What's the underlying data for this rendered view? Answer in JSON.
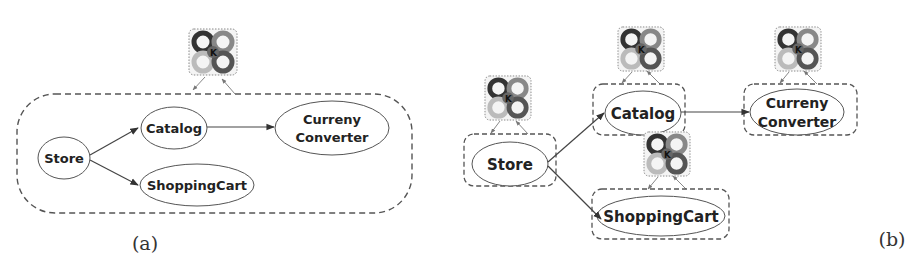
{
  "figure": {
    "panels": [
      {
        "id": "a",
        "caption": "(a)",
        "nodes": [
          {
            "id": "store",
            "label": [
              "Store"
            ]
          },
          {
            "id": "catalog",
            "label": [
              "Catalog"
            ]
          },
          {
            "id": "currency",
            "label": [
              "Curreny",
              "Converter"
            ]
          },
          {
            "id": "cart",
            "label": [
              "ShoppingCart"
            ]
          }
        ],
        "edges": [
          {
            "from": "store",
            "to": "catalog"
          },
          {
            "from": "store",
            "to": "cart"
          },
          {
            "from": "catalog",
            "to": "currency"
          }
        ],
        "controllers": 1,
        "controller_icon": "mape-k-loop-icon",
        "controller_letters": [
          "A",
          "P",
          "M",
          "E",
          "K"
        ]
      },
      {
        "id": "b",
        "caption": "(b)",
        "nodes": [
          {
            "id": "store",
            "label": [
              "Store"
            ]
          },
          {
            "id": "catalog",
            "label": [
              "Catalog"
            ]
          },
          {
            "id": "currency",
            "label": [
              "Curreny",
              "Converter"
            ]
          },
          {
            "id": "cart",
            "label": [
              "ShoppingCart"
            ]
          }
        ],
        "edges": [
          {
            "from": "store",
            "to": "catalog"
          },
          {
            "from": "store",
            "to": "cart"
          },
          {
            "from": "catalog",
            "to": "currency"
          }
        ],
        "controllers": 4,
        "controller_icon": "mape-k-loop-icon",
        "controller_letters": [
          "A",
          "P",
          "M",
          "E",
          "K"
        ]
      }
    ]
  },
  "a": {
    "caption": "(a)",
    "store": "Store",
    "catalog": "Catalog",
    "currency_1": "Curreny",
    "currency_2": "Converter",
    "cart": "ShoppingCart"
  },
  "b": {
    "caption": "(b)",
    "store": "Store",
    "catalog": "Catalog",
    "currency_1": "Curreny",
    "currency_2": "Converter",
    "cart": "ShoppingCart"
  },
  "icon": {
    "k": "K"
  },
  "colors": {
    "stroke": "#444444",
    "dash": "#555555",
    "text": "#222222"
  }
}
